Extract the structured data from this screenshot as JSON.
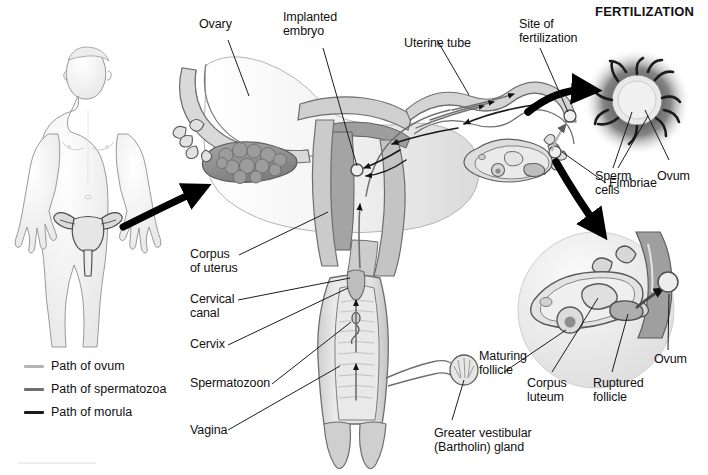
{
  "figure": {
    "inset_title": "FERTILIZATION"
  },
  "colors": {
    "ink": "#111111",
    "leader": "#111111",
    "outline": "#4a4a4a",
    "tissue_light": "#f2f2f2",
    "tissue_mid": "#d8d8d8",
    "tissue_dark": "#a8a8a8",
    "ovary": "#8e8e8e",
    "endometrium": "#9b9b9b",
    "path_ovum": "#b4b4b4",
    "path_spermatozoa": "#6f6f6f",
    "path_morula": "#1a1a1a",
    "arrow_black": "#000000",
    "glow": "#2a2a2a"
  },
  "legend": {
    "items": [
      {
        "label": "Path of ovum",
        "color": "#b4b4b4"
      },
      {
        "label": "Path of spermatozoa",
        "color": "#6f6f6f"
      },
      {
        "label": "Path of morula",
        "color": "#1a1a1a"
      }
    ]
  },
  "labels": {
    "ovary": "Ovary",
    "implanted_embryo_1": "Implanted",
    "implanted_embryo_2": "embryo",
    "uterine_tube": "Uterine tube",
    "site_of_fertilization_1": "Site of",
    "site_of_fertilization_2": "fertilization",
    "fertilization_title": "FERTILIZATION",
    "sperm_cells_1": "Sperm",
    "sperm_cells_2": "cells",
    "ovum_top": "Ovum",
    "fimbriae": "Fimbriae",
    "corpus_of_uterus_1": "Corpus",
    "corpus_of_uterus_2": "of uterus",
    "cervical_canal_1": "Cervical",
    "cervical_canal_2": "canal",
    "cervix": "Cervix",
    "spermatozoon": "Spermatozoon",
    "vagina": "Vagina",
    "maturing_follicle_1": "Maturing",
    "maturing_follicle_2": "follicle",
    "corpus_luteum_1": "Corpus",
    "corpus_luteum_2": "luteum",
    "ruptured_follicle_1": "Ruptured",
    "ruptured_follicle_2": "follicle",
    "ovum_bottom": "Ovum",
    "greater_vestibular_1": "Greater vestibular",
    "greater_vestibular_2": "(Bartholin) gland"
  }
}
